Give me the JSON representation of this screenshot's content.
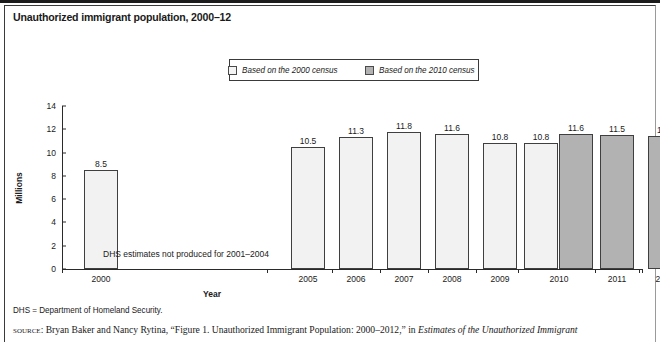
{
  "figure": {
    "title": "Unauthorized immigrant population, 2000–12",
    "annotation": "DHS estimates not produced for 2001–2004",
    "note": "DHS = Department of Homeland Security.",
    "source_prefix": "source",
    "source_sep": ": ",
    "source_text": "Bryan Baker and Nancy Rytina, “Figure 1. Unauthorized Immigrant Population: 2000–2012,” in ",
    "source_italic": "Estimates of the Unauthorized Immigrant"
  },
  "legend": {
    "items": [
      {
        "label": "Based on the 2000 census",
        "swatch": "light",
        "color": "#f4f4f4"
      },
      {
        "label": "Based on the 2010 census",
        "swatch": "dark",
        "color": "#b2b2b2"
      }
    ]
  },
  "chart_data": {
    "type": "bar",
    "title": "Unauthorized immigrant population, 2000–12",
    "xlabel": "Year",
    "ylabel": "Millions",
    "ylim": [
      0,
      14
    ],
    "yticks": [
      0,
      2,
      4,
      6,
      8,
      10,
      12,
      14
    ],
    "grid": false,
    "legend_position": "top-center",
    "categories": [
      "2000",
      "2005",
      "2006",
      "2007",
      "2008",
      "2009",
      "2010",
      "2011",
      "2012"
    ],
    "series": [
      {
        "name": "Based on the 2000 census",
        "color": "#f2f2f2",
        "values": [
          8.5,
          10.5,
          11.3,
          11.8,
          11.6,
          10.8,
          10.8,
          null,
          null
        ]
      },
      {
        "name": "Based on the 2010 census",
        "color": "#b2b2b2",
        "values": [
          null,
          null,
          null,
          null,
          null,
          null,
          11.6,
          11.5,
          11.4
        ]
      }
    ],
    "bars": [
      {
        "year": "2000",
        "value": "8.5",
        "series": "light",
        "x": 22,
        "w": 34
      },
      {
        "year": "2005",
        "value": "10.5",
        "series": "light",
        "x": 229,
        "w": 34
      },
      {
        "year": "2006",
        "value": "11.3",
        "series": "light",
        "x": 277,
        "w": 34
      },
      {
        "year": "2007",
        "value": "11.8",
        "series": "light",
        "x": 325,
        "w": 34
      },
      {
        "year": "2008",
        "value": "11.6",
        "series": "light",
        "x": 373,
        "w": 34
      },
      {
        "year": "2009",
        "value": "10.8",
        "series": "light",
        "x": 421,
        "w": 34
      },
      {
        "year": "2010",
        "value": "10.8",
        "series": "light",
        "x": 462,
        "w": 34
      },
      {
        "year": "2010",
        "value": "11.6",
        "series": "dark",
        "x": 497,
        "w": 34
      },
      {
        "year": "2011",
        "value": "11.5",
        "series": "dark",
        "x": 538,
        "w": 34
      },
      {
        "year": "2012",
        "value": "11.4",
        "series": "dark",
        "x": 586,
        "w": 34
      }
    ],
    "xticks": [
      {
        "label": "2000",
        "center": 39
      },
      {
        "label": "2005",
        "center": 246
      },
      {
        "label": "2006",
        "center": 294
      },
      {
        "label": "2007",
        "center": 342
      },
      {
        "label": "2008",
        "center": 390
      },
      {
        "label": "2009",
        "center": 438
      },
      {
        "label": "2010",
        "center": 497
      },
      {
        "label": "2011",
        "center": 555
      },
      {
        "label": "2012",
        "center": 603
      }
    ],
    "tickmarks": [
      0,
      205,
      270,
      318,
      366,
      414,
      456,
      533,
      577,
      580
    ]
  }
}
